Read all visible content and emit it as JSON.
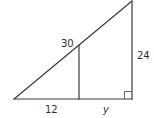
{
  "figure": {
    "type": "right-triangle-with-inner-segment",
    "vertices": {
      "left": {
        "x": 14,
        "y": 99
      },
      "right_angle": {
        "x": 132,
        "y": 99
      },
      "apex": {
        "x": 132,
        "y": 1
      },
      "inner_top": {
        "x": 79,
        "y": 45
      },
      "inner_bottom": {
        "x": 79,
        "y": 99
      }
    },
    "colors": {
      "line": "#3a3a3a",
      "text": "#2e2e2e",
      "background": "#ffffff"
    }
  },
  "labels": {
    "hypotenuse_segment": "30",
    "vertical_side": "24",
    "base_left": "12",
    "base_right": "y"
  }
}
